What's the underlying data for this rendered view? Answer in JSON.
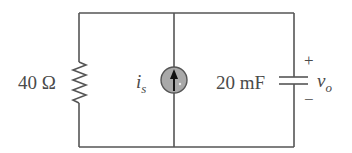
{
  "diagram": {
    "type": "circuit-schematic",
    "components": [
      {
        "id": "R1",
        "kind": "resistor",
        "value_label": "40 Ω",
        "position": "left-branch"
      },
      {
        "id": "Is",
        "kind": "current-source",
        "symbol": "i",
        "subscript": "s",
        "direction": "up",
        "position": "middle-branch"
      },
      {
        "id": "C1",
        "kind": "capacitor",
        "value_label": "20 mF",
        "position": "right-branch"
      }
    ],
    "output": {
      "symbol": "v",
      "subscript": "o",
      "plus": "+",
      "minus": "−"
    },
    "colors": {
      "wire": "#555555",
      "source_fill": "#a9a9a9",
      "text": "#4a4a4a"
    }
  },
  "labels": {
    "resistor": "40 Ω",
    "source_main": "i",
    "source_sub": "s",
    "capacitor": "20 mF",
    "vo_main": "v",
    "vo_sub": "o",
    "plus": "+",
    "minus": "−"
  }
}
